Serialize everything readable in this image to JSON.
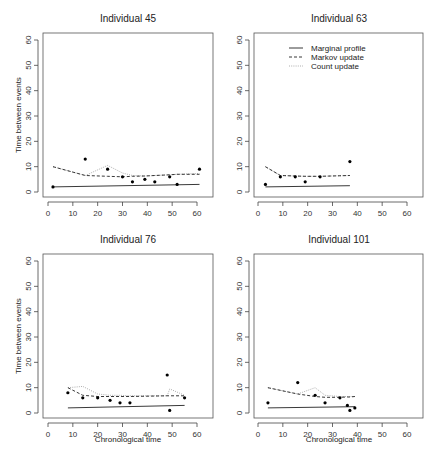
{
  "figure": {
    "y_axis_label": "Time between events",
    "x_axis_label": "Chronological time",
    "legend": {
      "marginal": "Marginal profile",
      "markov": "Markov update",
      "count": "Count update"
    }
  },
  "chart_data": [
    {
      "type": "scatter",
      "title": "Individual  45",
      "xlabel": "",
      "ylabel": "Time between events",
      "xlim": [
        0,
        62
      ],
      "ylim": [
        0,
        60
      ],
      "xticks": [
        0,
        10,
        20,
        30,
        40,
        50,
        60
      ],
      "yticks": [
        0,
        10,
        20,
        30,
        40,
        50,
        60
      ],
      "points": {
        "x": [
          2,
          15,
          24,
          30,
          34,
          39,
          43,
          49,
          52,
          61
        ],
        "y": [
          2,
          13,
          9,
          6,
          4,
          5,
          4,
          6,
          3,
          9
        ]
      },
      "series": [
        {
          "name": "Marginal profile",
          "style": "solid",
          "x": [
            2,
            61
          ],
          "y": [
            2,
            3
          ]
        },
        {
          "name": "Markov update",
          "style": "dashed",
          "x": [
            2,
            15,
            24,
            30,
            34,
            39,
            43,
            49,
            52,
            61
          ],
          "y": [
            10,
            6.5,
            6.2,
            6,
            6.2,
            6.3,
            6.5,
            6.8,
            7,
            7
          ]
        },
        {
          "name": "Count update",
          "style": "dotted",
          "x": [
            2,
            15,
            24,
            30,
            34,
            39,
            43,
            49,
            52,
            61
          ],
          "y": [
            10,
            6.5,
            10.5,
            7.5,
            6.5,
            6.3,
            6.5,
            6.8,
            7,
            7.3
          ]
        }
      ]
    },
    {
      "type": "scatter",
      "title": "Individual  63",
      "xlabel": "",
      "ylabel": "",
      "xlim": [
        0,
        62
      ],
      "ylim": [
        0,
        60
      ],
      "xticks": [
        0,
        10,
        20,
        30,
        40,
        50,
        60
      ],
      "yticks": [
        0,
        10,
        20,
        30,
        40,
        50,
        60
      ],
      "legend_position": "top-left",
      "points": {
        "x": [
          3,
          9,
          15,
          19,
          25,
          37
        ],
        "y": [
          3,
          6,
          6,
          4,
          6,
          12
        ]
      },
      "series": [
        {
          "name": "Marginal profile",
          "style": "solid",
          "x": [
            3,
            37
          ],
          "y": [
            2,
            2.5
          ]
        },
        {
          "name": "Markov update",
          "style": "dashed",
          "x": [
            3,
            9,
            15,
            19,
            25,
            37
          ],
          "y": [
            10,
            6.5,
            6.3,
            6.2,
            6.2,
            6.5
          ]
        },
        {
          "name": "Count update",
          "style": "dotted",
          "x": [
            3,
            9,
            15,
            19,
            25,
            37
          ],
          "y": [
            10,
            6.5,
            6.3,
            6.2,
            6.2,
            6.5
          ]
        }
      ]
    },
    {
      "type": "scatter",
      "title": "Individual  76",
      "xlabel": "Chronological time",
      "ylabel": "Time between events",
      "xlim": [
        0,
        62
      ],
      "ylim": [
        0,
        60
      ],
      "xticks": [
        0,
        10,
        20,
        30,
        40,
        50,
        60
      ],
      "yticks": [
        0,
        10,
        20,
        30,
        40,
        50,
        60
      ],
      "points": {
        "x": [
          8,
          14,
          20,
          25,
          29,
          33,
          48,
          49,
          55
        ],
        "y": [
          8,
          6,
          6,
          5,
          4,
          4,
          15,
          1,
          6
        ]
      },
      "series": [
        {
          "name": "Marginal profile",
          "style": "solid",
          "x": [
            8,
            55
          ],
          "y": [
            2,
            3
          ]
        },
        {
          "name": "Markov update",
          "style": "dashed",
          "x": [
            8,
            14,
            20,
            25,
            29,
            33,
            48,
            49,
            55
          ],
          "y": [
            10,
            7,
            6.5,
            6.5,
            6.5,
            6.5,
            6.8,
            6.8,
            6.8
          ]
        },
        {
          "name": "Count update",
          "style": "dotted",
          "x": [
            8,
            14,
            20,
            25,
            29,
            33,
            48,
            49,
            55
          ],
          "y": [
            10,
            10.5,
            7.5,
            7,
            7,
            6.8,
            6.8,
            9.5,
            7
          ]
        }
      ]
    },
    {
      "type": "scatter",
      "title": "Individual  101",
      "xlabel": "Chronological time",
      "ylabel": "",
      "xlim": [
        0,
        62
      ],
      "ylim": [
        0,
        60
      ],
      "xticks": [
        0,
        10,
        20,
        30,
        40,
        50,
        60
      ],
      "yticks": [
        0,
        10,
        20,
        30,
        40,
        50,
        60
      ],
      "points": {
        "x": [
          4,
          16,
          23,
          27,
          33,
          36,
          37,
          39
        ],
        "y": [
          4,
          12,
          7,
          4,
          6,
          3,
          1,
          2
        ]
      },
      "series": [
        {
          "name": "Marginal profile",
          "style": "solid",
          "x": [
            4,
            39
          ],
          "y": [
            2,
            2.5
          ]
        },
        {
          "name": "Markov update",
          "style": "dashed",
          "x": [
            4,
            16,
            23,
            27,
            33,
            36,
            37,
            39
          ],
          "y": [
            10,
            7.5,
            6.5,
            6.2,
            6.2,
            6.3,
            6.3,
            6.5
          ]
        },
        {
          "name": "Count update",
          "style": "dotted",
          "x": [
            4,
            16,
            23,
            27,
            33,
            36,
            37,
            39
          ],
          "y": [
            10,
            7.5,
            10,
            7,
            6.5,
            6.5,
            6.5,
            6.5
          ]
        }
      ]
    }
  ]
}
